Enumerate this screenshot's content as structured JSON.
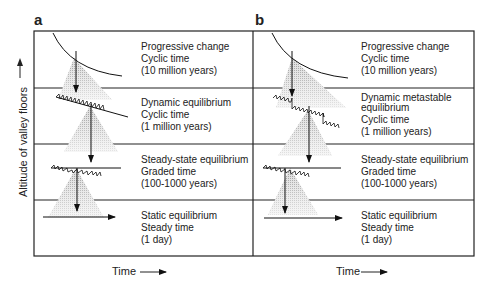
{
  "figure": {
    "y_axis_label": "Altitude of valley floors",
    "panels": [
      {
        "id": "a",
        "label": "a",
        "x_axis_label": "Time",
        "rows": [
          {
            "lines": [
              "Progressive change",
              "Cyclic time",
              "(10 million years)"
            ]
          },
          {
            "lines": [
              "Dynamic equilibrium",
              "Cyclic time",
              "(1 million years)"
            ]
          },
          {
            "lines": [
              "Steady-state equilibrium",
              "Graded time",
              "(100-1000 years)"
            ]
          },
          {
            "lines": [
              "Static equilibrium",
              "Steady time",
              "(1 day)"
            ]
          }
        ]
      },
      {
        "id": "b",
        "label": "b",
        "x_axis_label": "Time",
        "rows": [
          {
            "lines": [
              "Progressive change",
              "Cyclic time",
              "(10 million years)"
            ]
          },
          {
            "lines": [
              "Dynamic metastable",
              "equilibrium",
              "Cyclic time",
              "(1 million years)"
            ]
          },
          {
            "lines": [
              "Steady-state equilibrium",
              "Graded time",
              "(100-1000 years)"
            ]
          },
          {
            "lines": [
              "Static equilibrium",
              "Steady time",
              "(1 day)"
            ]
          }
        ]
      }
    ]
  }
}
